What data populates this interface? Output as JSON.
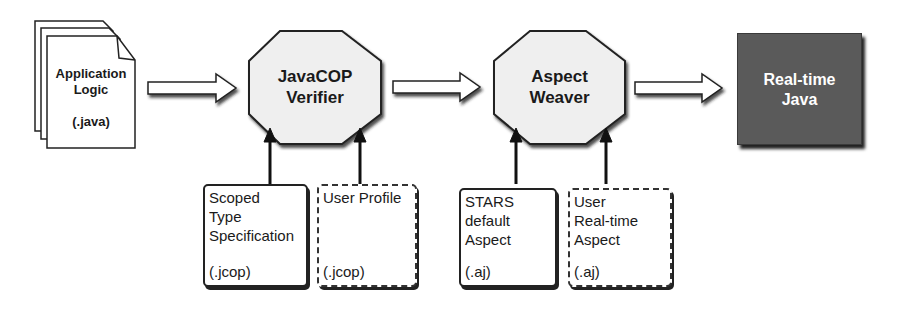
{
  "diagram": {
    "source": {
      "title_line1": "Application",
      "title_line2": "Logic",
      "extension": "(.java)"
    },
    "verifier": {
      "line1": "JavaCOP",
      "line2": "Verifier"
    },
    "weaver": {
      "line1": "Aspect",
      "line2": "Weaver"
    },
    "output": {
      "line1": "Real-time",
      "line2": "Java"
    },
    "inputs": [
      {
        "lines": [
          "Scoped",
          "Type",
          "Specification"
        ],
        "extension": "(.jcop)",
        "style": "solid"
      },
      {
        "lines": [
          "User Profile"
        ],
        "extension": "(.jcop)",
        "style": "dashed"
      },
      {
        "lines": [
          "STARS",
          "default",
          "Aspect"
        ],
        "extension": "(.aj)",
        "style": "solid"
      },
      {
        "lines": [
          "User",
          "Real-time",
          "Aspect"
        ],
        "extension": "(.aj)",
        "style": "dashed"
      }
    ],
    "colors": {
      "output_fill": "#5a5a5a",
      "octagon_fill": "#efefef",
      "stroke": "#222222"
    }
  }
}
